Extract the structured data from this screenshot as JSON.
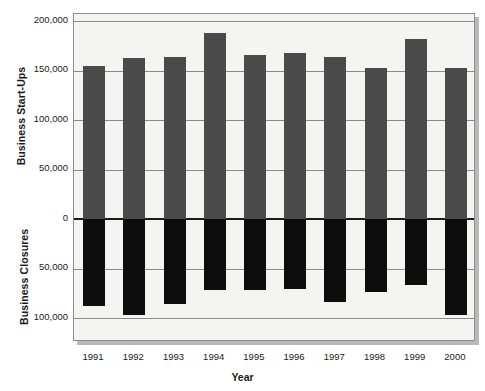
{
  "chart_data": {
    "type": "bar",
    "title": "",
    "subtitle": "",
    "xlabel": "Year",
    "ylabel_top": "Business Start-Ups",
    "ylabel_bottom": "Business Closures",
    "categories": [
      "1991",
      "1992",
      "1993",
      "1994",
      "1995",
      "1996",
      "1997",
      "1998",
      "1999",
      "2000"
    ],
    "series": [
      {
        "name": "Business Start-Ups",
        "direction": "up",
        "color": "#4a4a4a",
        "values": [
          155000,
          163000,
          164000,
          188000,
          166000,
          168000,
          164000,
          153000,
          182000,
          153000
        ]
      },
      {
        "name": "Business Closures",
        "direction": "down",
        "color": "#0d0d0d",
        "values": [
          88000,
          97000,
          86000,
          72000,
          72000,
          71000,
          84000,
          74000,
          67000,
          97000
        ]
      }
    ],
    "ylim": [
      -110000,
      200000
    ],
    "yticks_top": [
      200000,
      150000,
      100000,
      50000,
      0
    ],
    "yticks_bottom": [
      50000,
      100000
    ],
    "ytick_labels_top": [
      "200,000",
      "150,000",
      "100,000",
      "50,000",
      "0"
    ],
    "ytick_labels_bottom": [
      "50,000",
      "100,000"
    ],
    "grid": true,
    "legend": "none",
    "plot_background": "#f4f4f2",
    "frame_color": "#8d8d8d"
  },
  "axis": {
    "y_top_title": "Business Start-Ups",
    "y_bottom_title": "Business Closures",
    "x_title": "Year",
    "ticks": [
      {
        "label": "200,000",
        "value": 200000
      },
      {
        "label": "150,000",
        "value": 150000
      },
      {
        "label": "100,000",
        "value": 100000
      },
      {
        "label": "50,000",
        "value": 50000
      },
      {
        "label": "0",
        "value": 0
      },
      {
        "label": "50,000",
        "value": -50000
      },
      {
        "label": "100,000",
        "value": -100000
      }
    ]
  }
}
